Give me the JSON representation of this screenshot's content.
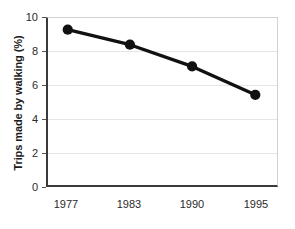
{
  "chart_data": {
    "type": "line",
    "title": "",
    "xlabel": "",
    "ylabel": "Trips made by walking (%)",
    "categories": [
      "1977",
      "1983",
      "1990",
      "1995"
    ],
    "x": [
      1977,
      1983,
      1990,
      1995
    ],
    "values": [
      9.3,
      8.4,
      7.1,
      5.4
    ],
    "series": [
      {
        "name": "Trips made by walking",
        "values": [
          9.3,
          8.4,
          7.1,
          5.4
        ]
      }
    ],
    "ylim": [
      0,
      10
    ],
    "yticks": [
      0,
      2,
      4,
      6,
      8,
      10
    ],
    "ytick_labels": [
      "0",
      "2",
      "4",
      "6",
      "8",
      "10"
    ],
    "xtick_labels": [
      "1977",
      "1983",
      "1990",
      "1995"
    ],
    "grid": "horizontal",
    "legend": "none",
    "line_color": "#111111",
    "marker_color": "#111111",
    "grid_color": "#e6e6e6",
    "axis_color": "#3a3a3a",
    "background_color": "#ffffff"
  }
}
